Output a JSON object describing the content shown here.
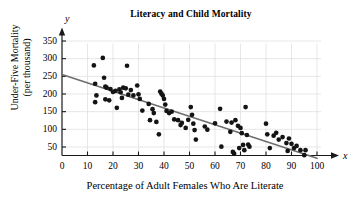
{
  "chart_data": {
    "type": "scatter",
    "title": "Literacy and Child Mortality",
    "xlabel": "Percentage of Adult Females Who Are Literate",
    "ylabel_line1": "Under-Five Mortality",
    "ylabel_line2": "(per thousand)",
    "x_axis_letter": "x",
    "y_axis_letter": "y",
    "xlim": [
      0,
      100
    ],
    "ylim": [
      0,
      375
    ],
    "xticks": [
      0,
      10,
      20,
      30,
      40,
      50,
      60,
      70,
      80,
      90,
      100
    ],
    "yticks": [
      50,
      100,
      150,
      200,
      250,
      300,
      350
    ],
    "grid": true,
    "legend": null,
    "point_color": "#141414",
    "trendline_color": "#6e6e6e",
    "axis_color": "#1a1a1a",
    "grid_color": "#dcdcdc",
    "trendline": {
      "label": "least-squares regression line",
      "x_start": 0,
      "y_start": 255,
      "x_end": 100,
      "y_end": 18
    },
    "points": [
      [
        12.5,
        281
      ],
      [
        13.0,
        229
      ],
      [
        13.5,
        196
      ],
      [
        13.0,
        177
      ],
      [
        16.0,
        302
      ],
      [
        16.5,
        246
      ],
      [
        17.0,
        221
      ],
      [
        17.5,
        218
      ],
      [
        17.0,
        185
      ],
      [
        18.5,
        182
      ],
      [
        19.0,
        214
      ],
      [
        20.0,
        206
      ],
      [
        21.0,
        209
      ],
      [
        21.5,
        161
      ],
      [
        22.5,
        213
      ],
      [
        23.0,
        205
      ],
      [
        23.5,
        189
      ],
      [
        24.0,
        218
      ],
      [
        25.5,
        280
      ],
      [
        25.0,
        216
      ],
      [
        26.0,
        198
      ],
      [
        27.0,
        211
      ],
      [
        28.0,
        196
      ],
      [
        29.5,
        224
      ],
      [
        30.0,
        199
      ],
      [
        30.5,
        186
      ],
      [
        31.5,
        153
      ],
      [
        34.0,
        172
      ],
      [
        34.5,
        126
      ],
      [
        35.5,
        157
      ],
      [
        36.0,
        146
      ],
      [
        37.0,
        121
      ],
      [
        38.0,
        86
      ],
      [
        38.5,
        207
      ],
      [
        39.0,
        201
      ],
      [
        39.5,
        196
      ],
      [
        40.0,
        186
      ],
      [
        40.5,
        170
      ],
      [
        41.0,
        152
      ],
      [
        42.0,
        146
      ],
      [
        43.0,
        150
      ],
      [
        44.0,
        128
      ],
      [
        45.5,
        126
      ],
      [
        46.5,
        112
      ],
      [
        47.0,
        118
      ],
      [
        48.5,
        104
      ],
      [
        49.5,
        127
      ],
      [
        50.5,
        163
      ],
      [
        51.0,
        141
      ],
      [
        51.5,
        116
      ],
      [
        52.0,
        98
      ],
      [
        52.5,
        71
      ],
      [
        56.0,
        108
      ],
      [
        57.0,
        99
      ],
      [
        60.0,
        117
      ],
      [
        62.0,
        158
      ],
      [
        62.5,
        51
      ],
      [
        64.5,
        122
      ],
      [
        66.0,
        93
      ],
      [
        66.5,
        119
      ],
      [
        67.0,
        36
      ],
      [
        67.5,
        31
      ],
      [
        68.0,
        126
      ],
      [
        69.0,
        110
      ],
      [
        69.5,
        47
      ],
      [
        70.0,
        104
      ],
      [
        70.5,
        89
      ],
      [
        71.0,
        56
      ],
      [
        71.5,
        41
      ],
      [
        72.0,
        163
      ],
      [
        72.5,
        84
      ],
      [
        73.0,
        57
      ],
      [
        73.5,
        51
      ],
      [
        80.0,
        116
      ],
      [
        80.5,
        86
      ],
      [
        81.5,
        47
      ],
      [
        83.0,
        82
      ],
      [
        84.0,
        90
      ],
      [
        85.0,
        71
      ],
      [
        86.5,
        78
      ],
      [
        88.0,
        61
      ],
      [
        88.5,
        39
      ],
      [
        89.0,
        74
      ],
      [
        90.0,
        59
      ],
      [
        91.0,
        47
      ],
      [
        92.0,
        53
      ],
      [
        93.5,
        41
      ],
      [
        95.0,
        27
      ],
      [
        95.5,
        41
      ]
    ]
  }
}
